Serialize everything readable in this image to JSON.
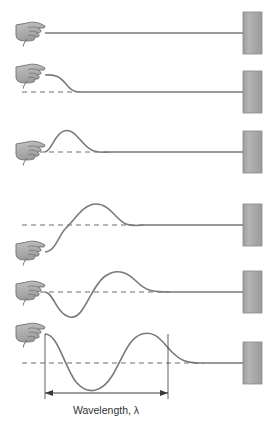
{
  "figure": {
    "title": "",
    "annotation": {
      "wavelength_label": "Wavelength, λ"
    },
    "colors": {
      "rope": "#7a7a7a",
      "wall_fill": "#a8a8a8",
      "wall_stroke": "#8a8a8a",
      "hand_fill": "#b0b0b0",
      "hand_stroke": "#6e6e6e",
      "dashed_line": "#6e6e6e",
      "measure_line": "#3a3a3a",
      "label_text": "#333333",
      "background": "#ffffff"
    },
    "geometry": {
      "wall_x": 243,
      "wall_width": 19,
      "wall_height": 42,
      "hand_x": 14,
      "rope_start_x": 45,
      "canvas_width": 277,
      "canvas_height": 425
    },
    "panels": [
      {
        "index": 1,
        "name": "rope-at-rest",
        "baseline_y": 33,
        "hand_y": 33,
        "wall_center_y": 33,
        "has_dashed_line": false,
        "wave_path": "M45,33 L243,33",
        "caption": ""
      },
      {
        "index": 2,
        "name": "half-pulse-started",
        "baseline_y": 92,
        "hand_y": 76,
        "wall_center_y": 92,
        "has_dashed_line": true,
        "dashed_from_x": 22,
        "dashed_to_x": 80,
        "wave_path": "M45,75 C56,74 60,77 66,84 C72,91 74,92 82,92 L243,92",
        "caption": ""
      },
      {
        "index": 3,
        "name": "single-pulse-crest",
        "baseline_y": 152,
        "hand_y": 152,
        "wall_center_y": 152,
        "has_dashed_line": true,
        "dashed_from_x": 22,
        "dashed_to_x": 112,
        "wave_path": "M45,152 C52,151 54,134 64,131 C76,127 82,148 94,151 C102,153 104,152 112,152 L243,152",
        "caption": ""
      },
      {
        "index": 4,
        "name": "pulse-travelling-hand-low",
        "baseline_y": 225,
        "hand_y": 252,
        "wall_center_y": 225,
        "has_dashed_line": true,
        "dashed_from_x": 22,
        "dashed_to_x": 140,
        "wave_path": "M45,252 C56,251 58,236 66,228 C76,218 84,204 96,204 C110,204 116,220 126,224 C134,227 136,225 144,225 L243,225",
        "caption": ""
      },
      {
        "index": 5,
        "name": "trough-and-crest",
        "baseline_y": 292,
        "hand_y": 292,
        "wall_center_y": 292,
        "has_dashed_line": true,
        "dashed_from_x": 22,
        "dashed_to_x": 170,
        "wave_path": "M45,292 C54,293 56,314 70,317 C84,320 90,288 104,277 C116,268 126,271 136,281 C146,291 152,292 170,292 L243,292",
        "caption": ""
      },
      {
        "index": 6,
        "name": "full-wave-wavelength",
        "baseline_y": 363,
        "hand_y": 334,
        "wall_center_y": 363,
        "has_dashed_line": true,
        "dashed_from_x": 22,
        "dashed_to_x": 204,
        "wave_path": "M45,334 C58,334 64,366 76,382 C88,396 102,392 112,376 C122,360 128,338 142,334 C156,330 162,342 172,352 C180,360 186,363 200,363 L243,363",
        "caption": ""
      }
    ],
    "measurement": {
      "name": "wavelength",
      "label": "Wavelength, λ",
      "from_x": 45,
      "to_x": 168,
      "arrow_y": 393,
      "tick_top_y": 334,
      "tick_bottom_y": 399,
      "label_x": 106,
      "label_y": 414
    }
  }
}
